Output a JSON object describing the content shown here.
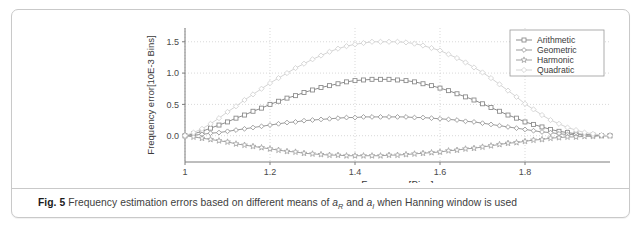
{
  "figure": {
    "label": "Fig. 5",
    "caption_part1": "Frequency estimation errors based on different means of ",
    "var1": "a",
    "var1_sub": "R",
    "caption_part2": " and ",
    "var2": "a",
    "var2_sub": "I",
    "caption_part3": " when Hanning window is used"
  },
  "chart_data": {
    "type": "line",
    "title": "",
    "xlabel": "Frequency[Bins]",
    "ylabel": "Frequency error[10E-3 Bins]",
    "xlim": [
      1.0,
      2.0
    ],
    "ylim": [
      -0.42,
      1.72
    ],
    "xticks": [
      1.0,
      1.2,
      1.4,
      1.6,
      1.8
    ],
    "xticklabels": [
      "1",
      "1.2",
      "1.4",
      "1.6",
      "1.8"
    ],
    "yticks": [
      0.0,
      0.5,
      1.0,
      1.5
    ],
    "yticklabels": [
      "0.0",
      "0.5",
      "1.0",
      "1.5"
    ],
    "grid": true,
    "grid_style": "dotted",
    "legend_position": "top-right",
    "x": [
      1.0,
      1.02,
      1.04,
      1.06,
      1.08,
      1.1,
      1.12,
      1.14,
      1.16,
      1.18,
      1.2,
      1.22,
      1.24,
      1.26,
      1.28,
      1.3,
      1.32,
      1.34,
      1.36,
      1.38,
      1.4,
      1.42,
      1.44,
      1.46,
      1.48,
      1.5,
      1.52,
      1.54,
      1.56,
      1.58,
      1.6,
      1.62,
      1.64,
      1.66,
      1.68,
      1.7,
      1.72,
      1.74,
      1.76,
      1.78,
      1.8,
      1.82,
      1.84,
      1.86,
      1.88,
      1.9,
      1.92,
      1.94,
      1.96,
      1.98,
      2.0
    ],
    "series": [
      {
        "name": "Arithmetic",
        "marker": "square",
        "color": "#8d8d8d",
        "values": [
          0.0,
          0.03,
          0.07,
          0.12,
          0.17,
          0.22,
          0.28,
          0.33,
          0.39,
          0.44,
          0.5,
          0.55,
          0.6,
          0.64,
          0.69,
          0.73,
          0.77,
          0.8,
          0.83,
          0.86,
          0.88,
          0.89,
          0.9,
          0.9,
          0.9,
          0.89,
          0.88,
          0.86,
          0.83,
          0.8,
          0.76,
          0.72,
          0.67,
          0.62,
          0.57,
          0.51,
          0.45,
          0.39,
          0.33,
          0.28,
          0.22,
          0.18,
          0.14,
          0.1,
          0.07,
          0.05,
          0.03,
          0.02,
          0.01,
          0.0,
          0.0
        ]
      },
      {
        "name": "Geometric",
        "marker": "diamond",
        "color": "#9a9a9a",
        "values": [
          0.0,
          0.01,
          0.02,
          0.04,
          0.05,
          0.07,
          0.09,
          0.11,
          0.13,
          0.15,
          0.17,
          0.19,
          0.21,
          0.22,
          0.24,
          0.25,
          0.26,
          0.27,
          0.28,
          0.29,
          0.29,
          0.3,
          0.3,
          0.3,
          0.3,
          0.3,
          0.3,
          0.29,
          0.29,
          0.28,
          0.27,
          0.26,
          0.25,
          0.23,
          0.22,
          0.2,
          0.18,
          0.16,
          0.14,
          0.12,
          0.1,
          0.08,
          0.06,
          0.05,
          0.03,
          0.02,
          0.02,
          0.01,
          0.01,
          0.0,
          0.0
        ]
      },
      {
        "name": "Harmonic",
        "marker": "star",
        "color": "#a0a0a0",
        "values": [
          0.0,
          -0.02,
          -0.04,
          -0.06,
          -0.08,
          -0.1,
          -0.13,
          -0.15,
          -0.17,
          -0.19,
          -0.21,
          -0.23,
          -0.25,
          -0.26,
          -0.28,
          -0.29,
          -0.3,
          -0.31,
          -0.31,
          -0.32,
          -0.32,
          -0.32,
          -0.32,
          -0.32,
          -0.31,
          -0.31,
          -0.3,
          -0.29,
          -0.28,
          -0.27,
          -0.26,
          -0.24,
          -0.23,
          -0.21,
          -0.2,
          -0.18,
          -0.16,
          -0.14,
          -0.12,
          -0.11,
          -0.09,
          -0.07,
          -0.06,
          -0.04,
          -0.03,
          -0.02,
          -0.02,
          -0.01,
          -0.01,
          0.0,
          0.0
        ]
      },
      {
        "name": "Quadratic",
        "marker": "diamond-open",
        "color": "#d4d4d4",
        "values": [
          0.0,
          0.05,
          0.11,
          0.19,
          0.28,
          0.38,
          0.47,
          0.57,
          0.66,
          0.75,
          0.84,
          0.92,
          1.0,
          1.08,
          1.15,
          1.22,
          1.28,
          1.34,
          1.39,
          1.43,
          1.46,
          1.48,
          1.5,
          1.5,
          1.5,
          1.5,
          1.49,
          1.47,
          1.44,
          1.4,
          1.36,
          1.3,
          1.24,
          1.17,
          1.09,
          1.01,
          0.92,
          0.82,
          0.72,
          0.62,
          0.51,
          0.42,
          0.33,
          0.25,
          0.19,
          0.13,
          0.09,
          0.05,
          0.03,
          0.01,
          0.0
        ]
      }
    ]
  }
}
